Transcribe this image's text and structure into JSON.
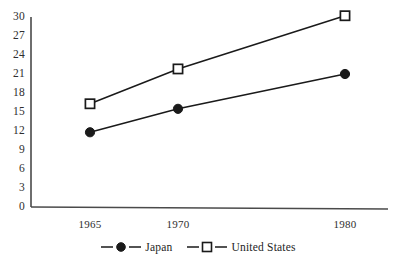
{
  "chart_data": {
    "type": "line",
    "title": "",
    "subtitle": "",
    "xlabel": "",
    "ylabel": "",
    "categories": [
      "1965",
      "1970",
      "1980"
    ],
    "x_positions_px": [
      90,
      178,
      345
    ],
    "series": [
      {
        "name": "Japan",
        "marker": "filled-circle",
        "color": "#1a1a1a",
        "values": [
          11.8,
          15.5,
          21.0
        ]
      },
      {
        "name": "United States",
        "marker": "open-square",
        "color": "#1a1a1a",
        "values": [
          16.3,
          21.8,
          30.2
        ]
      }
    ],
    "yticks": [
      0,
      3,
      6,
      9,
      12,
      15,
      18,
      21,
      24,
      27,
      30
    ],
    "ytick_labels": [
      "0",
      "3",
      "6",
      "9",
      "12",
      "15",
      "18",
      "21",
      "24",
      "27",
      "30"
    ],
    "ylim": [
      0,
      30
    ],
    "xticks": [
      "1965",
      "1970",
      "1980"
    ],
    "grid": false,
    "legend_position": "bottom-center",
    "legend": [
      {
        "label": "Japan",
        "marker": "filled-circle"
      },
      {
        "label": "United States",
        "marker": "open-square"
      }
    ]
  },
  "axes": {
    "line_color": "#4a4a4a",
    "y_axis_x_px": 31,
    "x_axis_y_px": 207,
    "plot_top_px": 17,
    "plot_right_px": 388
  }
}
